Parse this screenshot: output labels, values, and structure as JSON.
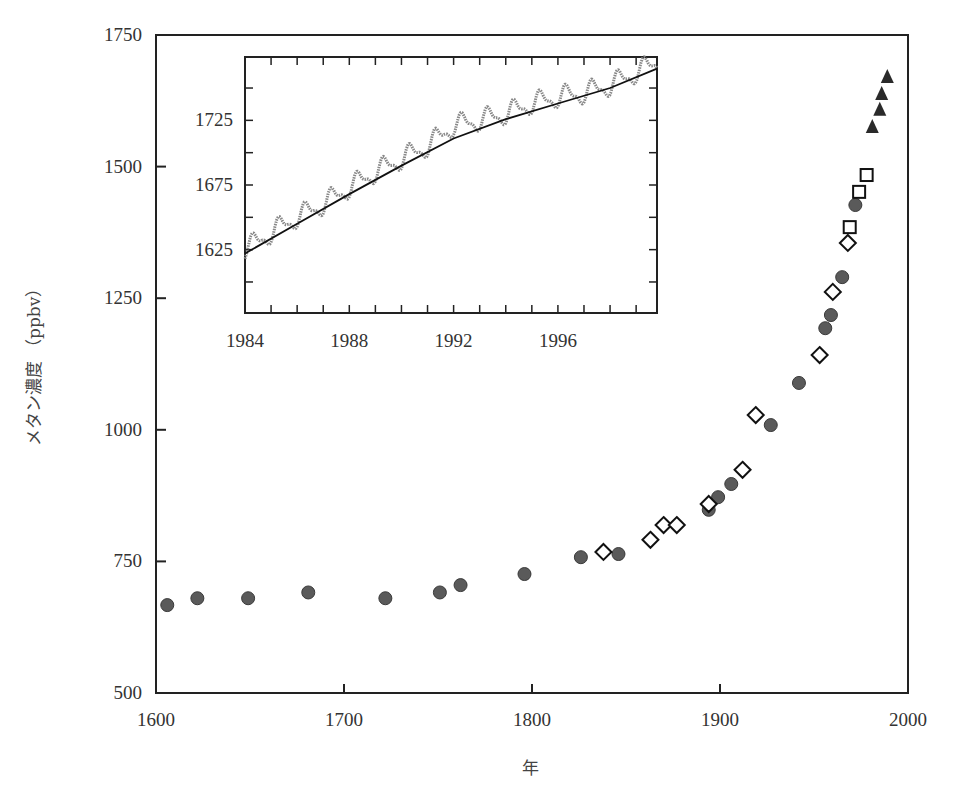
{
  "chart_data": {
    "type": "scatter",
    "title": "",
    "xlabel": "年",
    "ylabel": "メタン濃度 （ppbv）",
    "xlim": [
      1600,
      2000
    ],
    "ylim": [
      500,
      1750
    ],
    "x_ticks": [
      "1600",
      "1700",
      "1800",
      "1900",
      "2000"
    ],
    "y_ticks": [
      "500",
      "750",
      "1000",
      "1250",
      "1500",
      "1750"
    ],
    "grid": false,
    "legend": null,
    "series": [
      {
        "name": "circles",
        "marker": "filled-circle",
        "color": "#555555",
        "x": [
          1606,
          1622,
          1649,
          1681,
          1722,
          1751,
          1762,
          1796,
          1826,
          1846,
          1894,
          1899,
          1906,
          1927,
          1942,
          1956,
          1959,
          1965,
          1972
        ],
        "values": [
          667,
          680,
          680,
          691,
          680,
          691,
          705,
          726,
          758,
          764,
          848,
          872,
          897,
          1009,
          1089,
          1193,
          1218,
          1290,
          1427
        ]
      },
      {
        "name": "diamonds",
        "marker": "open-diamond",
        "color": "#111111",
        "x": [
          1838,
          1863,
          1870,
          1877,
          1894,
          1912,
          1919,
          1953,
          1960,
          1968
        ],
        "values": [
          768,
          791,
          819,
          819,
          859,
          924,
          1028,
          1142,
          1262,
          1355
        ]
      },
      {
        "name": "squares",
        "marker": "open-square",
        "color": "#111111",
        "x": [
          1969,
          1974,
          1978
        ],
        "values": [
          1385,
          1452,
          1484
        ]
      },
      {
        "name": "triangles",
        "marker": "filled-triangle",
        "color": "#222222",
        "x": [
          1981,
          1985,
          1986,
          1989
        ],
        "values": [
          1575,
          1608,
          1638,
          1670
        ]
      }
    ],
    "inset": {
      "type": "line",
      "xlim": [
        1984,
        1999.8
      ],
      "ylim": [
        1576,
        1774
      ],
      "x_ticks": [
        "1984",
        "1988",
        "1992",
        "1996"
      ],
      "y_ticks": [
        "1625",
        "1675",
        "1725"
      ],
      "series": [
        {
          "name": "monthly (seasonal)",
          "style": "dotted-gray",
          "x": [
            1984,
            1985,
            1986,
            1987,
            1988,
            1989,
            1990,
            1991,
            1992,
            1993,
            1994,
            1995,
            1996,
            1997,
            1998,
            1999,
            1999.8
          ],
          "values": [
            1625,
            1638,
            1650,
            1660,
            1673,
            1685,
            1695,
            1705,
            1721,
            1725,
            1730,
            1738,
            1743,
            1746,
            1752,
            1762,
            1770
          ]
        },
        {
          "name": "trend",
          "style": "solid-black",
          "x": [
            1984,
            1986,
            1988,
            1990,
            1992,
            1994,
            1996,
            1998,
            1999.8
          ],
          "values": [
            1622,
            1645,
            1668,
            1690,
            1711,
            1726,
            1738,
            1750,
            1765
          ]
        }
      ]
    }
  }
}
